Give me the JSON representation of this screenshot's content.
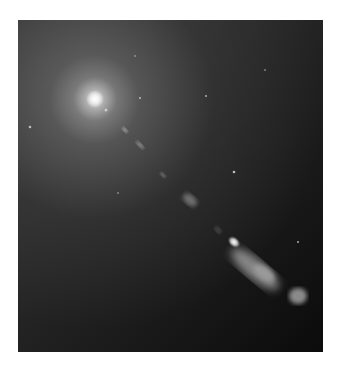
{
  "image": {
    "description": "Grayscale astronomical photograph of a galaxy core with a relativistic jet extending toward the lower right",
    "subject": "galaxy nucleus and jet",
    "colors": {
      "page_background": "#ffffff",
      "halo": "#aaaaaa",
      "dark_background": "#0b0b0b",
      "core": "#ffffff"
    }
  }
}
